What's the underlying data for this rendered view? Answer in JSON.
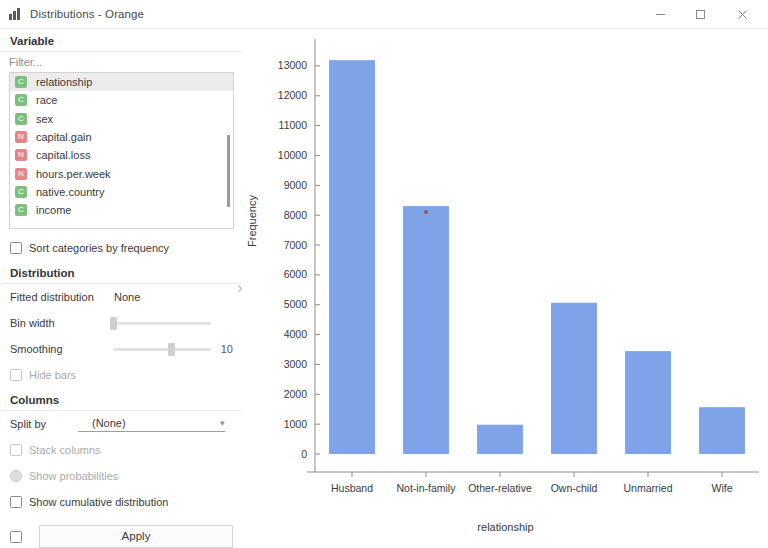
{
  "window": {
    "title": "Distributions - Orange",
    "icon": "bar-chart-icon",
    "minimize": "–",
    "maximize": "☐",
    "close": "✕"
  },
  "sidebar": {
    "variable_section": {
      "title": "Variable",
      "filter_placeholder": "Filter...",
      "items": [
        {
          "label": "relationship",
          "type": "C",
          "selected": true
        },
        {
          "label": "race",
          "type": "C",
          "selected": false
        },
        {
          "label": "sex",
          "type": "C",
          "selected": false
        },
        {
          "label": "capital.gain",
          "type": "N",
          "selected": false
        },
        {
          "label": "capital.loss",
          "type": "N",
          "selected": false
        },
        {
          "label": "hours.per.week",
          "type": "N",
          "selected": false
        },
        {
          "label": "native.country",
          "type": "C",
          "selected": false
        },
        {
          "label": "income",
          "type": "C",
          "selected": false
        }
      ],
      "sort_checkbox": "Sort categories by frequency"
    },
    "distribution_section": {
      "title": "Distribution",
      "fitted_label": "Fitted distribution",
      "fitted_value": "None",
      "bin_width_label": "Bin width",
      "smoothing_label": "Smoothing",
      "smoothing_value": "10",
      "hide_bars_label": "Hide bars"
    },
    "columns_section": {
      "title": "Columns",
      "split_by_label": "Split by",
      "split_by_value": "(None)",
      "stack_columns_label": "Stack columns",
      "show_probabilities_label": "Show probabilities",
      "show_cumulative_label": "Show cumulative distribution"
    },
    "apply_label": "Apply",
    "collapse_icon": "›"
  },
  "chart_data": {
    "type": "bar",
    "title": "",
    "xlabel": "relationship",
    "ylabel": "Frequency",
    "categories": [
      "Husband",
      "Not-in-family",
      "Other-relative",
      "Own-child",
      "Unmarried",
      "Wife"
    ],
    "values": [
      13193,
      8305,
      981,
      5068,
      3446,
      1568
    ],
    "ylim": [
      0,
      13500
    ],
    "yticks": [
      0,
      1000,
      2000,
      3000,
      4000,
      5000,
      6000,
      7000,
      8000,
      9000,
      10000,
      11000,
      12000,
      13000
    ],
    "grid": false,
    "legend": false,
    "bar_color": "#7ea3e8"
  }
}
